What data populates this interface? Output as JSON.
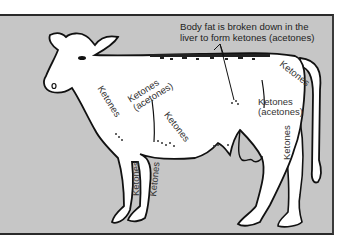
{
  "diagram": {
    "annotation": {
      "line1": "Body fat is broken down in the",
      "line2": "liver to form ketones (acetones)"
    },
    "labels": [
      {
        "id": "neck",
        "text": "Ketones"
      },
      {
        "id": "chest-top",
        "line1": "Ketones",
        "line2": "(acetones)"
      },
      {
        "id": "shoulder",
        "text": "Ketones"
      },
      {
        "id": "flank",
        "line1": "Ketones",
        "line2": "(acetones)"
      },
      {
        "id": "rump",
        "text": "Ketones"
      },
      {
        "id": "front-leg-left",
        "text": "Ketones"
      },
      {
        "id": "front-leg-right",
        "text": "Ketones"
      },
      {
        "id": "hind-leg",
        "text": "Ketones"
      }
    ],
    "colors": {
      "panel": "#c6c6c6",
      "outline": "#111111",
      "body": "#ffffff",
      "fat_stipple": "#222222",
      "text": "#333333"
    }
  }
}
